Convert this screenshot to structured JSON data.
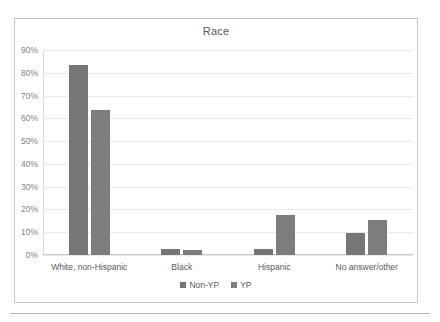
{
  "chart_data": {
    "type": "bar",
    "title": "Race",
    "xlabel": "",
    "ylabel": "",
    "ylim": [
      0,
      90
    ],
    "ytick_labels": [
      "90%",
      "80%",
      "70%",
      "60%",
      "50%",
      "40%",
      "30%",
      "20%",
      "10%",
      "0%"
    ],
    "ytick_values": [
      90,
      80,
      70,
      60,
      50,
      40,
      30,
      20,
      10,
      0
    ],
    "grid": true,
    "legend_position": "bottom",
    "categories": [
      "White, non-Hispanic",
      "Black",
      "Hispanic",
      "No answer/other"
    ],
    "series": [
      {
        "name": "Non-YP",
        "color": "#767676",
        "values": [
          83.5,
          2.5,
          2.8,
          9.5
        ]
      },
      {
        "name": "YP",
        "color": "#7d7d7d",
        "values": [
          63.5,
          2.0,
          17.5,
          15.2
        ]
      }
    ]
  }
}
